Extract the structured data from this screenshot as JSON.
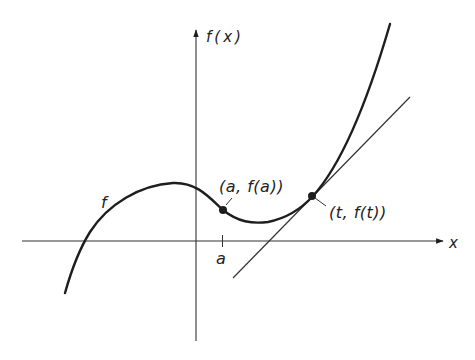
{
  "diagram": {
    "type": "function-graph-with-tangent",
    "colors": {
      "background": "#ffffff",
      "ink": "#1e1e1e",
      "axis": "#333333"
    },
    "axes": {
      "x_label": "x",
      "y_label": "f(x)"
    },
    "curve": {
      "label": "f"
    },
    "points": [
      {
        "id": "a",
        "label": "(a, f(a))"
      },
      {
        "id": "t",
        "label": "(t, f(t))"
      }
    ],
    "ticks": [
      {
        "label": "a"
      }
    ],
    "tangent_line": {
      "at_point": "t"
    }
  }
}
